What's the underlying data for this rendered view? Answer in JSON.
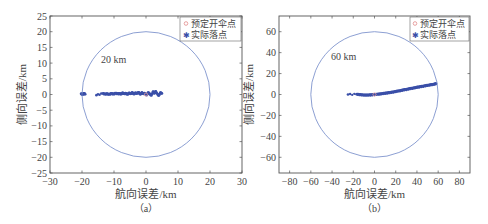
{
  "chart_data": [
    {
      "type": "scatter",
      "panel_label": "（a）",
      "title": "",
      "xlabel": "航向误差/km",
      "ylabel": "侧向误差/km",
      "xlim": [
        -30,
        30
      ],
      "ylim": [
        -25,
        25
      ],
      "xticks": [
        -30,
        -20,
        -10,
        0,
        10,
        20,
        30
      ],
      "yticks": [
        -25,
        -20,
        -15,
        -10,
        -5,
        0,
        5,
        10,
        15,
        20,
        25
      ],
      "grid": false,
      "legend_position": "upper right",
      "legend": [
        "预定开伞点",
        "实际落点"
      ],
      "annotation": {
        "text": "20 km",
        "x": -11,
        "y": 12
      },
      "circle": {
        "center": [
          0,
          0
        ],
        "radius": 20
      },
      "series": [
        {
          "name": "预定开伞点",
          "marker": "o",
          "color": "#e8a0a0",
          "x": [
            0
          ],
          "y": [
            0
          ]
        },
        {
          "name": "实际落点",
          "marker": "*",
          "color": "#3a4fa8",
          "x": [
            -20.3,
            -19.8,
            -19.4,
            -19.0,
            -15.5,
            -13.5,
            -12.8,
            -12.2,
            -11.5,
            -10.8,
            -10.2,
            -9.5,
            -8.8,
            -8.3,
            -7.8,
            -7.3,
            -6.8,
            -6.3,
            -5.8,
            -5.3,
            -4.8,
            -4.3,
            -3.8,
            -3.3,
            -2.8,
            -2.3,
            -1.8,
            -1.3,
            -0.8,
            -0.3,
            0.2,
            0.7,
            1.2,
            1.7,
            2.2,
            2.6,
            3.0,
            3.5,
            4.0,
            4.5,
            5.0
          ],
          "y": [
            0.2,
            0.0,
            0.3,
            0.1,
            -0.2,
            0.3,
            0.1,
            0.2,
            0.0,
            0.3,
            0.1,
            0.4,
            0.2,
            0.3,
            0.1,
            0.5,
            0.2,
            0.4,
            0.0,
            0.5,
            0.2,
            0.6,
            0.1,
            0.5,
            0.3,
            0.7,
            0.0,
            0.6,
            0.2,
            0.4,
            -0.2,
            0.6,
            0.1,
            -0.3,
            0.9,
            0.3,
            1.0,
            0.2,
            -0.4,
            0.6,
            0.3
          ]
        }
      ]
    },
    {
      "type": "scatter",
      "panel_label": "（b）",
      "title": "",
      "xlabel": "航向误差/km",
      "ylabel": "侧向误差/km",
      "xlim": [
        -90,
        90
      ],
      "ylim": [
        -75,
        75
      ],
      "xticks": [
        -80,
        -60,
        -40,
        -20,
        0,
        20,
        40,
        60,
        80
      ],
      "yticks": [
        -60,
        -40,
        -20,
        0,
        20,
        40,
        60
      ],
      "grid": false,
      "legend_position": "upper right",
      "legend": [
        "预定开伞点",
        "实际落点"
      ],
      "annotation": {
        "text": "60 km",
        "x": -43,
        "y": 36
      },
      "circle": {
        "center": [
          0,
          0
        ],
        "radius": 60
      },
      "series": [
        {
          "name": "预定开伞点",
          "marker": "o",
          "color": "#e8a0a0",
          "x": [
            0
          ],
          "y": [
            0
          ]
        },
        {
          "name": "实际落点",
          "marker": "*",
          "color": "#3a4fa8",
          "x": [
            -25,
            -17,
            -15,
            -13,
            -11,
            -9,
            -7,
            -5,
            -3,
            -1,
            1,
            3,
            5,
            7,
            9,
            11,
            13,
            15,
            17,
            19,
            21,
            23,
            25,
            27,
            29,
            31,
            33,
            35,
            37,
            39,
            41,
            43,
            45,
            47,
            49,
            51,
            53,
            55,
            57,
            58
          ],
          "y": [
            0,
            0.2,
            0,
            -0.3,
            -0.5,
            -0.6,
            -0.6,
            -0.5,
            -0.4,
            -0.2,
            0,
            0.2,
            0.4,
            0.7,
            1.0,
            1.3,
            1.6,
            1.9,
            2.2,
            2.6,
            3.0,
            3.4,
            3.8,
            4.2,
            4.6,
            5.0,
            5.4,
            5.8,
            6.2,
            6.6,
            7.0,
            7.3,
            7.7,
            8.1,
            8.5,
            8.8,
            9.2,
            9.6,
            10.0,
            10.3
          ]
        }
      ]
    }
  ],
  "figure": {
    "panels": [
      {
        "panel_label": "（a）",
        "xlabel": "航向误差/km",
        "ylabel": "侧向误差/km",
        "annotation": "20 km",
        "xticks": [
          "−30",
          "−20",
          "−10",
          "0",
          "10",
          "20",
          "30"
        ],
        "yticks": [
          "25",
          "20",
          "15",
          "10",
          "5",
          "0",
          "−5",
          "−10",
          "−15",
          "−20",
          "−25"
        ],
        "legend": [
          "预定开伞点",
          "实际落点"
        ]
      },
      {
        "panel_label": "（b）",
        "xlabel": "航向误差/km",
        "ylabel": "侧向误差/km",
        "annotation": "60 km",
        "xticks": [
          "−80",
          "−60",
          "−40",
          "−20",
          "0",
          "20",
          "40",
          "60",
          "80"
        ],
        "yticks": [
          "60",
          "40",
          "20",
          "0",
          "−20",
          "−40",
          "−60"
        ],
        "legend": [
          "预定开伞点",
          "实际落点"
        ]
      }
    ],
    "colors": {
      "axis": "#555555",
      "circle": "#6f86c6",
      "actual": "#3a4fa8",
      "planned": "#e8a0a0"
    }
  }
}
